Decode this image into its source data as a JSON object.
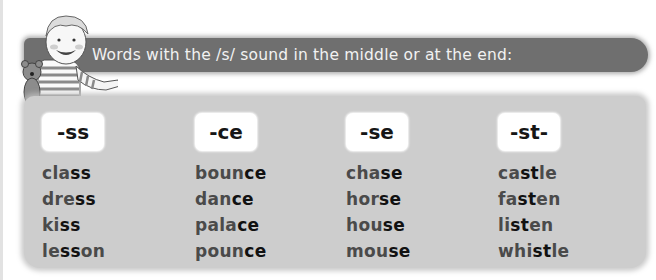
{
  "banner": {
    "title": "Words with the /s/ sound in the middle or at the end:"
  },
  "illustration": {
    "description": "boy holding teddy bear, pointing"
  },
  "colors": {
    "banner_bg": "#6f6f6f",
    "banner_text": "#f2f2f2",
    "panel_bg": "#cdcdcd",
    "header_bg": "#ffffff",
    "word_text": "#4a4a4a",
    "highlight_text": "#111111"
  },
  "columns": [
    {
      "header": "-ss",
      "words": [
        {
          "pre": "cla",
          "hl": "ss",
          "post": ""
        },
        {
          "pre": "dre",
          "hl": "ss",
          "post": ""
        },
        {
          "pre": "ki",
          "hl": "ss",
          "post": ""
        },
        {
          "pre": "le",
          "hl": "ss",
          "post": "on"
        }
      ]
    },
    {
      "header": "-ce",
      "words": [
        {
          "pre": "boun",
          "hl": "ce",
          "post": ""
        },
        {
          "pre": "dan",
          "hl": "ce",
          "post": ""
        },
        {
          "pre": "pala",
          "hl": "ce",
          "post": ""
        },
        {
          "pre": "poun",
          "hl": "ce",
          "post": ""
        }
      ]
    },
    {
      "header": "-se",
      "words": [
        {
          "pre": "cha",
          "hl": "se",
          "post": ""
        },
        {
          "pre": "hor",
          "hl": "se",
          "post": ""
        },
        {
          "pre": "hou",
          "hl": "se",
          "post": ""
        },
        {
          "pre": "mou",
          "hl": "se",
          "post": ""
        }
      ]
    },
    {
      "header": "-st-",
      "words": [
        {
          "pre": "ca",
          "hl": "st",
          "post": "le"
        },
        {
          "pre": "fa",
          "hl": "st",
          "post": "en"
        },
        {
          "pre": "li",
          "hl": "st",
          "post": "en"
        },
        {
          "pre": "whi",
          "hl": "st",
          "post": "le"
        }
      ]
    }
  ]
}
